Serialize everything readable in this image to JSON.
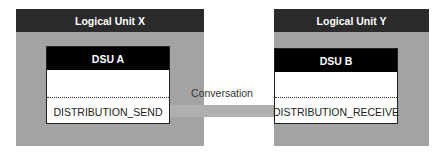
{
  "diagram": {
    "left_unit": {
      "title": "Logical Unit X",
      "dsu": {
        "title": "DSU A",
        "function": "DISTRIBUTION_SEND"
      }
    },
    "right_unit": {
      "title": "Logical Unit Y",
      "dsu": {
        "title": "DSU B",
        "function": "DISTRIBUTION_RECEIVE"
      }
    },
    "connector": {
      "label": "Conversation"
    },
    "colors": {
      "unit_body": "#a3a3a3",
      "unit_header": "#2b2b2b",
      "dsu_header": "#000000",
      "connector": "#b0b0b0"
    }
  }
}
